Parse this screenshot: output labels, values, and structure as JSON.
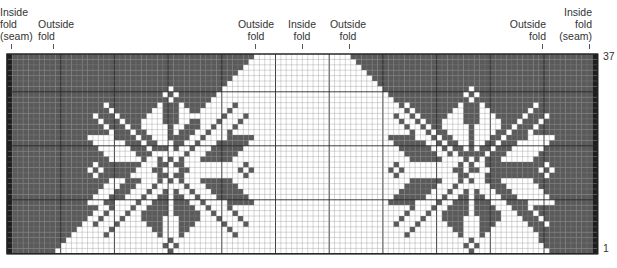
{
  "labels": [
    {
      "id": "inside-fold-seam-left",
      "text": "Inside\nfold\n(seam)",
      "x": 0,
      "y": 6,
      "align": "left",
      "tick_x": 11
    },
    {
      "id": "outside-fold-left",
      "text": "Outside\nfold",
      "x": 38,
      "y": 18,
      "align": "left",
      "tick_x": 53
    },
    {
      "id": "outside-fold-center-left",
      "text": "Outside\nfold",
      "x": 234,
      "y": 18,
      "align": "center",
      "tick_x": 255,
      "w": 44
    },
    {
      "id": "inside-fold-center",
      "text": "Inside\nfold",
      "x": 282,
      "y": 18,
      "align": "center",
      "tick_x": 302,
      "w": 40
    },
    {
      "id": "outside-fold-center-right",
      "text": "Outside\nfold",
      "x": 326,
      "y": 18,
      "align": "center",
      "tick_x": 349,
      "w": 44
    },
    {
      "id": "outside-fold-right",
      "text": "Outside\nfold",
      "x": 500,
      "y": 18,
      "align": "right",
      "tick_x": 542,
      "w": 46
    },
    {
      "id": "inside-fold-seam-right",
      "text": "Inside\nfold\n(seam)",
      "x": 554,
      "y": 6,
      "align": "right",
      "tick_x": 589,
      "w": 38
    }
  ],
  "row_numbers": {
    "top": "37",
    "bottom": "1"
  },
  "grid": {
    "rows": 37,
    "cols": 110,
    "cell_w": 5.37,
    "cell_h": 5.4,
    "major_every": 10,
    "colors": {
      "dark": "#5a5a5a",
      "light": "#ffffff",
      "seam": "#1e1e1e",
      "line": "#2a2a2a",
      "minor_line": "#8a8a8a"
    },
    "triangle": {
      "center_col": 55,
      "top_half_width": 9,
      "bottom_half_width": 46
    }
  },
  "motif": {
    "left_origin_col": 15,
    "right_origin_col": 71,
    "top_row": 5,
    "bitmap": [
      "...............................",
      "...............#...............",
      "..............#.#..............",
      "...............#...............",
      "...#.........#...#.........#...",
      "....#.......##...##.......#....",
      ".#...#.....###...###.....#...#.",
      "..#...#...####...####...#...#..",
      "...#...#..#####.#####..#...#...",
      "....#...#..####.####..#...#....",
      "#####....#..###.###..#....#####",
      ".######...#..##.##..#...######.",
      "..######...#..#.#..#...######..",
      "...######...#.....#...######...",
      "....######...#.#.#...######....",
      ".#...........##.##...........#.",
      "#.#.........##...##.........#.#",
      ".#...........##.##...........#.",
      "....######...#.#.#...######....",
      "...######...#.....#...######...",
      "..######...#..#.#..#...######..",
      ".######...#..##.##..#...######.",
      "#####....#..###.###..#....#####",
      "....#...#..####.####..#...#....",
      "...#...#..#####.#####..#...#...",
      "..#...#...####...####...#...#..",
      ".#...#.....###...###.....#...#.",
      "....#.......##...##.......#....",
      "...#.........#...#.........#...",
      "...............#...............",
      "..............#.#..............",
      "...............#..............."
    ]
  }
}
